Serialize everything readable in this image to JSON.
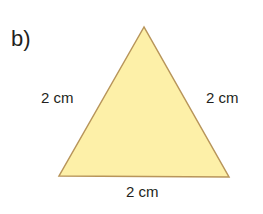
{
  "diagram": {
    "part_label": "b)",
    "shape": "equilateral-triangle",
    "fill_color": "#fdf0a8",
    "stroke_color": "#b8955a",
    "sides": {
      "left": "2 cm",
      "right": "2 cm",
      "bottom": "2 cm"
    }
  }
}
